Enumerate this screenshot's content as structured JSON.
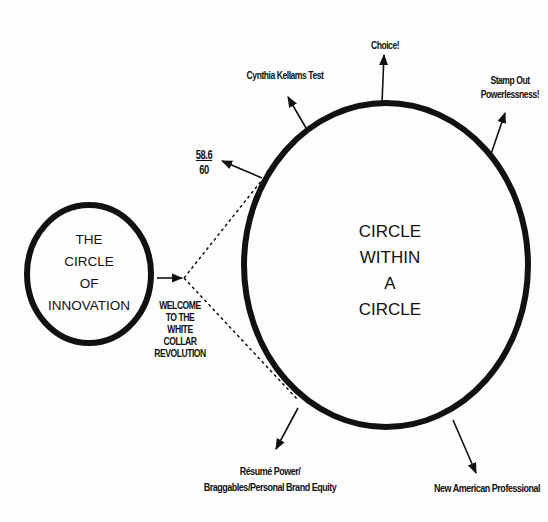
{
  "diagram": {
    "small_circle": {
      "lines": [
        "THE",
        "CIRCLE",
        "OF",
        "INNOVATION"
      ]
    },
    "transition_label": {
      "lines": [
        "WELCOME",
        "TO THE",
        "WHITE",
        "COLLAR",
        "REVOLUTION"
      ]
    },
    "big_circle": {
      "lines": [
        "CIRCLE",
        "WITHIN",
        "A",
        "CIRCLE"
      ]
    },
    "callouts": {
      "score": {
        "numerator": "58.6",
        "denominator": "60"
      },
      "cynthia": "Cynthia Kellams Test",
      "choice": "Choice!",
      "stamp_out": {
        "lines": [
          "Stamp Out",
          "Powerlessness!"
        ]
      },
      "resume": {
        "lines": [
          "Résumé Power/",
          "Braggables/Personal Brand Equity"
        ]
      },
      "new_american": "New American Professional"
    },
    "colors": {
      "stroke": "#111111",
      "background": "#fdfdfd"
    }
  }
}
